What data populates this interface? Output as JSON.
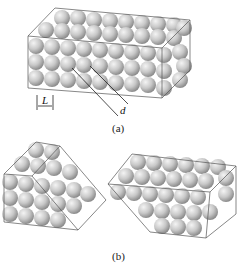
{
  "figure": {
    "panels": [
      {
        "id": "a",
        "caption": "(a)",
        "description": "rectangular block of close-packed spheres in a simple cubic-like lattice",
        "labels": {
          "spacing": "L",
          "plane_distance": "d"
        }
      },
      {
        "id": "b",
        "caption": "(b)",
        "description": "two blocks of spheres cut along a diagonal plane"
      }
    ],
    "colors": {
      "sphere_light": "#f2f2f2",
      "sphere_mid": "#c6c6c6",
      "sphere_dark": "#8d8d8d",
      "edge": "#555555"
    }
  }
}
